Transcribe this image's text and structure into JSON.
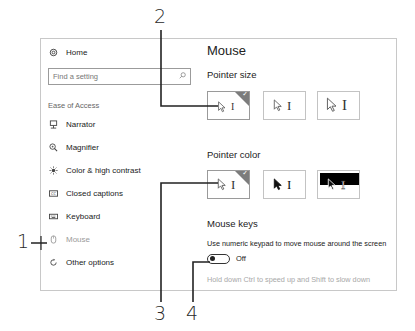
{
  "sidebar": {
    "home": {
      "label": "Home",
      "icon": "gear-icon"
    },
    "search": {
      "placeholder": "Find a setting",
      "icon": "search-icon"
    },
    "section_label": "Ease of Access",
    "items": [
      {
        "label": "Narrator",
        "icon": "narrator-icon"
      },
      {
        "label": "Magnifier",
        "icon": "magnifier-icon"
      },
      {
        "label": "Color & high contrast",
        "icon": "contrast-icon"
      },
      {
        "label": "Closed captions",
        "icon": "captions-icon"
      },
      {
        "label": "Keyboard",
        "icon": "keyboard-icon"
      },
      {
        "label": "Mouse",
        "icon": "mouse-icon",
        "active": true
      },
      {
        "label": "Other options",
        "icon": "other-options-icon"
      }
    ]
  },
  "main": {
    "title": "Mouse",
    "pointer_size": {
      "heading": "Pointer size",
      "options": [
        "small",
        "medium",
        "large"
      ],
      "selected": 0
    },
    "pointer_color": {
      "heading": "Pointer color",
      "options": [
        "white",
        "black",
        "inverted"
      ],
      "selected": 0
    },
    "mouse_keys": {
      "heading": "Mouse keys",
      "description": "Use numeric keypad to move mouse around the screen",
      "toggle_state": "Off",
      "hint": "Hold down Ctrl to speed up and Shift to slow down"
    }
  },
  "callouts": [
    "1",
    "2",
    "3",
    "4"
  ],
  "colors": {
    "border": "#c8c8c8",
    "selected_corner": "#7c7c7c",
    "active_nav": "#9a9a9a",
    "hint_text": "#a8a8a8"
  }
}
